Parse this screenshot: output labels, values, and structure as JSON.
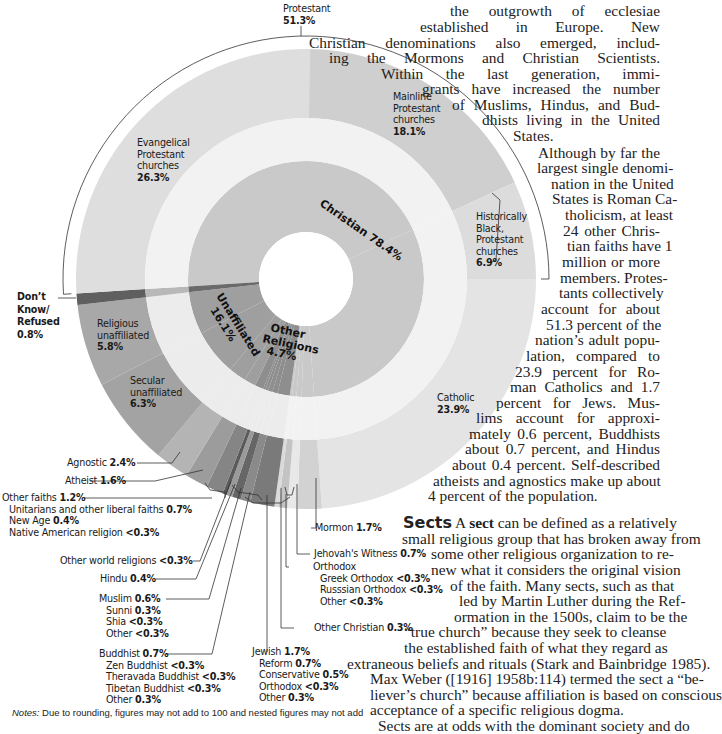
{
  "chart_data": {
    "type": "sunburst",
    "title": "",
    "center": [
      306,
      279
    ],
    "radii": {
      "hole": 47,
      "inner_outer": 118,
      "gap_outer": 161,
      "outer_outer": 230,
      "bracket": 243
    },
    "inner_ring": [
      {
        "name": "Christian",
        "value": 78.4,
        "label": "Christian 78.4%",
        "color": "#c9c9c9"
      },
      {
        "name": "Other Religions",
        "value": 4.7,
        "label": "Other Religions 4.7%",
        "color": "#8e8e8e"
      },
      {
        "name": "Unaffiliated",
        "value": 16.1,
        "label": "Unaffiliated 16.1%",
        "color": "#9f9f9f"
      },
      {
        "name": "Don't Know/Refused",
        "value": 0.8,
        "label": "Don't Know/Refused 0.8%",
        "color": "#6a6a6a"
      }
    ],
    "outer_ring": [
      {
        "name": "Mainline Protestant churches",
        "value": 18.1,
        "parent": "Christian",
        "group": "Protestant",
        "color": "#cfcfcf"
      },
      {
        "name": "Historically Black, Protestant churches",
        "value": 6.9,
        "parent": "Christian",
        "group": "Protestant",
        "color": "#dcdcdc"
      },
      {
        "name": "Catholic",
        "value": 23.9,
        "parent": "Christian",
        "color": "#e4e4e4"
      },
      {
        "name": "Mormon",
        "value": 1.7,
        "parent": "Christian",
        "color": "#d2d2d2"
      },
      {
        "name": "Jehovah's Witness",
        "value": 0.7,
        "parent": "Christian",
        "color": "#e8e8e8"
      },
      {
        "name": "Orthodox",
        "value": 0.6,
        "parent": "Christian",
        "color": "#c4c4c4",
        "children": [
          {
            "name": "Greek Orthodox",
            "value": "<0.3"
          },
          {
            "name": "Russsian Orthodox",
            "value": "<0.3"
          },
          {
            "name": "Other",
            "value": "<0.3"
          }
        ]
      },
      {
        "name": "Other Christian",
        "value": 0.3,
        "parent": "Christian",
        "color": "#dadada"
      },
      {
        "name": "Jewish",
        "value": 1.7,
        "parent": "Other Religions",
        "color": "#7a7a7a",
        "children": [
          {
            "name": "Reform",
            "value": 0.7
          },
          {
            "name": "Conservative",
            "value": 0.5
          },
          {
            "name": "Orthodox",
            "value": "<0.3"
          },
          {
            "name": "Other",
            "value": 0.3
          }
        ]
      },
      {
        "name": "Buddhist",
        "value": 0.7,
        "parent": "Other Religions",
        "color": "#8a8a8a",
        "children": [
          {
            "name": "Zen Buddhist",
            "value": "<0.3"
          },
          {
            "name": "Theravada Buddhist",
            "value": "<0.3"
          },
          {
            "name": "Tibetan Buddhist",
            "value": "<0.3"
          },
          {
            "name": "Other",
            "value": 0.3
          }
        ]
      },
      {
        "name": "Muslim",
        "value": 0.6,
        "parent": "Other Religions",
        "color": "#666666",
        "children": [
          {
            "name": "Sunni",
            "value": 0.3
          },
          {
            "name": "Shia",
            "value": "<0.3"
          },
          {
            "name": "Other",
            "value": "<0.3"
          }
        ]
      },
      {
        "name": "Hindu",
        "value": 0.4,
        "parent": "Other Religions",
        "color": "#9a9a9a"
      },
      {
        "name": "Other world religions",
        "value": 0.3,
        "parent": "Other Religions",
        "color": "#5a5a5a"
      },
      {
        "name": "Other faiths",
        "value": 1.2,
        "parent": "Other Religions",
        "color": "#858585",
        "children": [
          {
            "name": "Unitarians and other liberal faiths",
            "value": 0.7
          },
          {
            "name": "New Age",
            "value": 0.4
          },
          {
            "name": "Native American religion",
            "value": "<0.3"
          }
        ]
      },
      {
        "name": "Atheist",
        "value": 1.6,
        "parent": "Unaffiliated",
        "color": "#9c9c9c"
      },
      {
        "name": "Agnostic",
        "value": 2.4,
        "parent": "Unaffiliated",
        "color": "#b4b4b4"
      },
      {
        "name": "Secular unaffiliated",
        "value": 6.3,
        "parent": "Unaffiliated",
        "color": "#a3a3a3"
      },
      {
        "name": "Religious unaffiliated",
        "value": 5.8,
        "parent": "Unaffiliated",
        "color": "#a8a8a8"
      },
      {
        "name": "Don't Know/Refused",
        "value": 0.8,
        "parent": "Don't Know/Refused",
        "color": "#5f5f5f"
      },
      {
        "name": "Evangelical Protestant churches",
        "value": 26.3,
        "parent": "Christian",
        "group": "Protestant",
        "color": "#dedede"
      }
    ],
    "groups": [
      {
        "name": "Protestant",
        "value": 51.3,
        "label": "Protestant 51.3%"
      }
    ]
  },
  "labels": {
    "protestant": {
      "name": "Protestant",
      "pct": "51.3%"
    },
    "evangelical": {
      "l1": "Evangelical",
      "l2": "Protestant",
      "l3": "churches",
      "pct": "26.3%"
    },
    "mainline": {
      "l1": "Mainline",
      "l2": "Protestant",
      "l3": "churches",
      "pct": "18.1%"
    },
    "hist_black": {
      "l1": "Historically",
      "l2": "Black,",
      "l3": "Protestant",
      "l4": "churches",
      "pct": "6.9%"
    },
    "catholic": {
      "name": "Catholic",
      "pct": "23.9%"
    },
    "christian": "Christian 78.4%",
    "unaffiliated": {
      "name": "Unaffiliated",
      "pct": "16.1%"
    },
    "other_religions": {
      "l1": "Other",
      "l2": "Religions",
      "pct": "4.7%"
    },
    "dont_know": {
      "l1": "Don’t",
      "l2": "Know/",
      "l3": "Refused",
      "pct": "0.8%"
    },
    "religious_unaff": {
      "l1": "Religious",
      "l2": "unaffiliated",
      "pct": "5.8%"
    },
    "secular_unaff": {
      "l1": "Secular",
      "l2": "unaffiliated",
      "pct": "6.3%"
    },
    "agnostic": {
      "name": "Agnostic",
      "pct": "2.4%"
    },
    "atheist": {
      "name": "Atheist",
      "pct": "1.6%"
    },
    "other_faiths": {
      "name": "Other faiths",
      "pct": "1.2%",
      "items": [
        {
          "name": "Unitarians and other liberal faiths",
          "pct": "0.7%"
        },
        {
          "name": "New Age",
          "pct": "0.4%"
        },
        {
          "name": "Native American religion",
          "pct": "<0.3%"
        }
      ]
    },
    "other_world": {
      "name": "Other world religions",
      "pct": "<0.3%"
    },
    "hindu": {
      "name": "Hindu",
      "pct": "0.4%"
    },
    "muslim": {
      "name": "Muslim",
      "pct": "0.6%",
      "items": [
        {
          "name": "Sunni",
          "pct": "0.3%"
        },
        {
          "name": "Shia",
          "pct": "<0.3%"
        },
        {
          "name": "Other",
          "pct": "<0.3%"
        }
      ]
    },
    "buddhist": {
      "name": "Buddhist",
      "pct": "0.7%",
      "items": [
        {
          "name": "Zen Buddhist",
          "pct": "<0.3%"
        },
        {
          "name": "Theravada Buddhist",
          "pct": "<0.3%"
        },
        {
          "name": "Tibetan Buddhist",
          "pct": "<0.3%"
        },
        {
          "name": "Other",
          "pct": "0.3%"
        }
      ]
    },
    "jewish": {
      "name": "Jewish",
      "pct": "1.7%",
      "items": [
        {
          "name": "Reform",
          "pct": "0.7%"
        },
        {
          "name": "Conservative",
          "pct": "0.5%"
        },
        {
          "name": "Orthodox",
          "pct": "<0.3%"
        },
        {
          "name": "Other",
          "pct": "0.3%"
        }
      ]
    },
    "mormon": {
      "name": "Mormon",
      "pct": "1.7%"
    },
    "jehovah": {
      "name": "Jehovah's Witness",
      "pct": "0.7%"
    },
    "orthodox": {
      "name": "Orthodox",
      "items": [
        {
          "name": "Greek Orthodox",
          "pct": "<0.3%"
        },
        {
          "name": "Russsian Orthodox",
          "pct": "<0.3%"
        },
        {
          "name": "Other",
          "pct": "<0.3%"
        }
      ]
    },
    "other_christian": {
      "name": "Other Christian",
      "pct": "0.3%"
    }
  },
  "notes": {
    "prefix": "Notes:",
    "text": " Due to rounding, figures may not add to 100 and nested figures may not add"
  },
  "body_top": [
    "the outgrowth of ecclesiae",
    "established in Europe. New",
    "Christian denominations also emerged, includ-",
    "ing the Mormons and Christian Scientists.",
    "Within the last generation, immi-",
    "grants have increased the number",
    "of Muslims, Hindus, and Bud-",
    "dhists living in the United",
    "States.",
    "Although by far the",
    "largest single denomi-",
    "nation in the United",
    "States is Roman Ca-",
    "tholicism, at least",
    "24 other Chris-",
    "tian faiths have 1",
    "million or more",
    "members. Protes-",
    "tants collectively",
    "account for about",
    "51.3 percent of the",
    "nation’s adult popu-",
    "lation, compared to",
    "23.9 percent for Ro-",
    "man Catholics and 1.7",
    "percent for Jews. Mus-",
    "lims account for approxi-",
    "mately 0.6 percent, Buddhists",
    "about 0.7 percent, and Hindus",
    "about 0.4 percent. Self-described",
    "atheists and agnostics make up about",
    "4 percent of the population."
  ],
  "sects": {
    "heading": "Sects",
    "lines": [
      " A sect can be defined as a relatively",
      "small religious group that has broken away from",
      "some other religious organization to re-",
      "new what it considers the original vision",
      "of the faith. Many sects, such as that",
      "led by Martin Luther during the Ref-",
      "ormation in the 1500s, claim to be the",
      "“true church” because they seek to cleanse",
      "the established faith of what they regard as",
      "extraneous beliefs and rituals (Stark and Bainbridge 1985).",
      "Max Weber ([1916] 1958b:114) termed the sect a “be-",
      "liever’s church” because affiliation is based on conscious",
      "acceptance of a specific religious dogma.",
      "Sects are at odds with the dominant society and do"
    ]
  }
}
